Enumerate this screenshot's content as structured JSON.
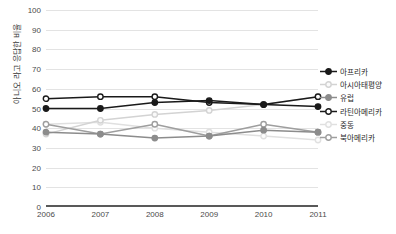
{
  "chart_data": {
    "type": "line",
    "title": "",
    "xlabel": "",
    "ylabel": "아니오 라고 응답한 비율",
    "categories": [
      "2006",
      "2007",
      "2008",
      "2009",
      "2010",
      "2011"
    ],
    "x": [
      2006,
      2007,
      2008,
      2009,
      2010,
      2011
    ],
    "ylim": [
      0,
      100
    ],
    "yticks": [
      "0",
      "10",
      "20",
      "30",
      "40",
      "50",
      "60",
      "70",
      "80",
      "90",
      "100"
    ],
    "ytick_values": [
      0,
      10,
      20,
      30,
      40,
      50,
      60,
      70,
      80,
      90,
      100
    ],
    "grid": true,
    "legend_position": "right",
    "series": [
      {
        "name": "아프리카",
        "values": [
          50,
          50,
          53,
          54,
          52,
          51
        ],
        "color": "#1a1a1a",
        "marker": "filled-circle",
        "marker_fill": "#1a1a1a"
      },
      {
        "name": "아시아태평양",
        "values": [
          37,
          44,
          47,
          49,
          52,
          56
        ],
        "color": "#d3d3d3",
        "marker": "open-circle",
        "marker_fill": "#fafafa"
      },
      {
        "name": "유럽",
        "values": [
          38,
          37,
          35,
          36,
          39,
          38
        ],
        "color": "#8c8c8c",
        "marker": "filled-circle",
        "marker_fill": "#8c8c8c"
      },
      {
        "name": "라틴아메리카",
        "values": [
          55,
          56,
          56,
          53,
          52,
          56
        ],
        "color": "#1a1a1a",
        "marker": "open-circle",
        "marker_fill": "#ffffff"
      },
      {
        "name": "중동",
        "values": [
          42,
          43,
          40,
          38,
          36,
          34
        ],
        "color": "#e0e0e0",
        "marker": "open-circle",
        "marker_fill": "#fcfcfc"
      },
      {
        "name": "북아메리카",
        "values": [
          42,
          37,
          42,
          36,
          42,
          38
        ],
        "color": "#9e9e9e",
        "marker": "open-circle",
        "marker_fill": "#ffffff"
      }
    ]
  },
  "legend": {
    "items": [
      {
        "label": "아프리카"
      },
      {
        "label": "아시아태평양"
      },
      {
        "label": "유럽"
      },
      {
        "label": "라틴아메리카"
      },
      {
        "label": "중동"
      },
      {
        "label": "북아메리카"
      }
    ]
  }
}
